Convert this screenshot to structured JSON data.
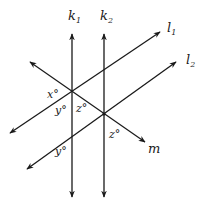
{
  "diagram": {
    "lines": [
      {
        "id": "k1",
        "name": "k",
        "subscript": "1",
        "kind": "vertical"
      },
      {
        "id": "k2",
        "name": "k",
        "subscript": "2",
        "kind": "vertical"
      },
      {
        "id": "l1",
        "name": "l",
        "subscript": "1",
        "kind": "rising"
      },
      {
        "id": "l2",
        "name": "l",
        "subscript": "2",
        "kind": "rising"
      },
      {
        "id": "m",
        "name": "m",
        "subscript": "",
        "kind": "falling"
      }
    ],
    "angle_labels": [
      {
        "id": "x-top-left",
        "text": "x°"
      },
      {
        "id": "y-upper",
        "text": "y°"
      },
      {
        "id": "z-upper",
        "text": "z°"
      },
      {
        "id": "z-lower",
        "text": "z°"
      },
      {
        "id": "y-lower",
        "text": "y°"
      }
    ],
    "stroke_color": "#1a1a1a",
    "background": "#ffffff"
  }
}
